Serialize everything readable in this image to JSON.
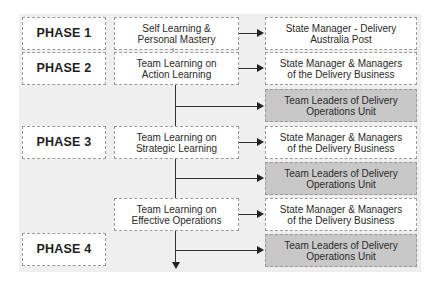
{
  "diagram": {
    "phases": [
      {
        "label": "PHASE 1"
      },
      {
        "label": "PHASE 2"
      },
      {
        "label": "PHASE 3"
      },
      {
        "label": "PHASE 4"
      }
    ],
    "learning_stages": [
      {
        "line1": "Self Learning &",
        "line2": "Personal Mastery"
      },
      {
        "line1": "Team Learning on",
        "line2": "Action Learning"
      },
      {
        "line1": "Team Learning on",
        "line2": "Strategic Learning"
      },
      {
        "line1": "Team Learning on",
        "line2": "Effective Operations"
      }
    ],
    "participants": [
      {
        "line1": "State Manager - Delivery",
        "line2": "Australia Post",
        "shaded": false
      },
      {
        "line1": "State Manager & Managers",
        "line2": "of the Delivery Business",
        "shaded": false
      },
      {
        "line1": "Team Leaders of Delivery",
        "line2": "Operations Unit",
        "shaded": true
      },
      {
        "line1": "State Manager & Managers",
        "line2": "of the Delivery Business",
        "shaded": false
      },
      {
        "line1": "Team Leaders of Delivery",
        "line2": "Operations Unit",
        "shaded": true
      },
      {
        "line1": "State Manager & Managers",
        "line2": "of the Delivery Business",
        "shaded": false
      },
      {
        "line1": "Team Leaders of Delivery",
        "line2": "Operations Unit",
        "shaded": true
      }
    ],
    "colors": {
      "panel": "#efefef",
      "box": "#ffffff",
      "shaded_box": "#c8c8c8",
      "line": "#333333"
    }
  }
}
